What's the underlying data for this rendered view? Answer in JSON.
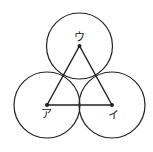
{
  "diagram": {
    "stroke_color": "#222222",
    "background": "#ffffff",
    "circle_radius": 33,
    "points": [
      {
        "id": "a",
        "label": "ア",
        "x": 47,
        "y": 105
      },
      {
        "id": "i",
        "label": "イ",
        "x": 112,
        "y": 105
      },
      {
        "id": "u",
        "label": "ウ",
        "x": 79.5,
        "y": 46
      }
    ],
    "labels": {
      "a": "ア",
      "i": "イ",
      "u": "ウ"
    }
  }
}
